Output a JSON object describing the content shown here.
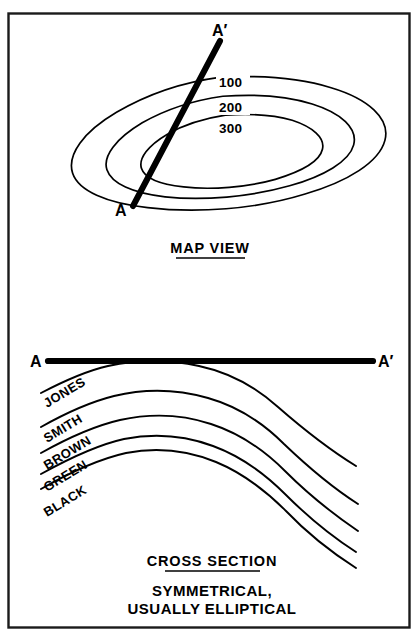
{
  "figure": {
    "background_color": "#ffffff",
    "ink_color": "#000000",
    "frame": {
      "x": 8,
      "y": 13,
      "width": 402,
      "height": 615,
      "stroke": "#1a1a1a"
    }
  },
  "map_view": {
    "caption": "MAP VIEW",
    "caption_underlined": true,
    "section_line": {
      "start_label": "A",
      "end_label": "A′",
      "start_point": [
        133,
        206
      ],
      "end_point": [
        220,
        41
      ]
    },
    "contours": [
      {
        "label": "100",
        "label_x": 223,
        "label_y": 85
      },
      {
        "label": "200",
        "label_x": 223,
        "label_y": 110
      },
      {
        "label": "300",
        "label_x": 223,
        "label_y": 130
      }
    ],
    "structure_type": "concentric closed contours, elongate ellipse",
    "labels": {
      "start": "A",
      "end": "A′"
    }
  },
  "cross_section": {
    "caption": "CROSS SECTION",
    "caption_underlined": true,
    "note_line_1": "SYMMETRICAL,",
    "note_line_2": "USUALLY ELLIPTICAL",
    "datum_line": {
      "start_label": "A",
      "end_label": "A′",
      "start_point": [
        48,
        361
      ],
      "end_point": [
        373,
        361
      ]
    },
    "beds": [
      {
        "name": "JONES",
        "label_x": 47,
        "label_y": 408,
        "label_rotation": -31
      },
      {
        "name": "SMITH",
        "label_x": 47,
        "label_y": 443,
        "label_rotation": -31
      },
      {
        "name": "BROWN",
        "label_x": 47,
        "label_y": 470,
        "label_rotation": -31
      },
      {
        "name": "GREEN",
        "label_x": 47,
        "label_y": 492,
        "label_rotation": -31
      },
      {
        "name": "BLACK",
        "label_x": 47,
        "label_y": 517,
        "label_rotation": -31
      }
    ],
    "fold_type": "anticline",
    "crest_x": 225
  }
}
